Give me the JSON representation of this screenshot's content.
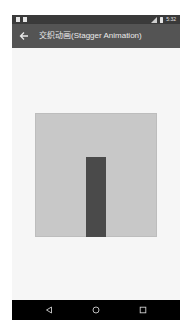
{
  "status_bar": {
    "left_icons": [
      "notification-icon",
      "notification-icon"
    ],
    "right_icons": [
      "signal-icon",
      "battery-icon"
    ],
    "time": "5:32"
  },
  "app_bar": {
    "back_icon": "arrow-left-icon",
    "title": "交织动画(Stagger Animation)"
  },
  "content": {
    "stage_color": "#c8c8c8",
    "bar_color": "#4a4a4a"
  },
  "nav_bar": {
    "buttons": [
      {
        "name": "back",
        "icon": "triangle-back-icon"
      },
      {
        "name": "home",
        "icon": "circle-home-icon"
      },
      {
        "name": "recents",
        "icon": "square-recents-icon"
      }
    ]
  },
  "colors": {
    "status_bar": "#3a3a3a",
    "app_bar": "#545454",
    "background": "#f6f6f6",
    "nav_bar": "#000000"
  }
}
